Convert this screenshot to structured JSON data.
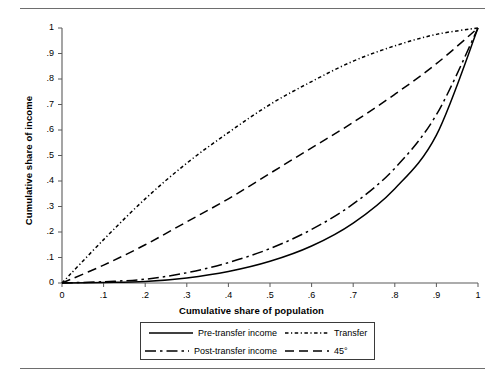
{
  "chart_data": {
    "type": "line",
    "title": "",
    "xlabel": "Cumulative share of population",
    "ylabel": "Cumulative share of income",
    "xlim": [
      0,
      1
    ],
    "ylim": [
      0,
      1
    ],
    "grid": false,
    "legend_position": "below-axes",
    "x_ticks": [
      "0",
      ".1",
      ".2",
      ".3",
      ".4",
      ".5",
      ".6",
      ".7",
      ".8",
      ".9",
      "1"
    ],
    "y_ticks": [
      "0",
      ".1",
      ".2",
      ".3",
      ".4",
      ".5",
      ".6",
      ".7",
      ".8",
      ".9",
      "1"
    ],
    "x": [
      0,
      0.1,
      0.2,
      0.3,
      0.4,
      0.5,
      0.6,
      0.7,
      0.8,
      0.9,
      1.0
    ],
    "series": [
      {
        "name": "Pre-transfer income",
        "style": "solid",
        "color": "#000000",
        "values": [
          0,
          0.002,
          0.006,
          0.02,
          0.045,
          0.085,
          0.145,
          0.235,
          0.37,
          0.58,
          1.0
        ]
      },
      {
        "name": "Transfer",
        "style": "dash-dot-dotted",
        "color": "#000000",
        "values": [
          0,
          0.17,
          0.33,
          0.47,
          0.59,
          0.7,
          0.79,
          0.87,
          0.93,
          0.975,
          1.0
        ]
      },
      {
        "name": "Post-transfer income",
        "style": "dash-dot",
        "color": "#000000",
        "values": [
          0,
          0.005,
          0.015,
          0.04,
          0.08,
          0.135,
          0.21,
          0.31,
          0.45,
          0.66,
          1.0
        ]
      },
      {
        "name": "45°",
        "style": "dashed",
        "color": "#000000",
        "values": [
          0,
          0.07,
          0.15,
          0.24,
          0.33,
          0.43,
          0.53,
          0.63,
          0.74,
          0.86,
          1.0
        ]
      }
    ]
  },
  "legend": {
    "entries": [
      {
        "label": "Pre-transfer income",
        "style": "solid"
      },
      {
        "label": "Transfer",
        "style": "dash-dot-dotted"
      },
      {
        "label": "Post-transfer income",
        "style": "dash-dot"
      },
      {
        "label": "45°",
        "style": "dashed"
      }
    ]
  }
}
